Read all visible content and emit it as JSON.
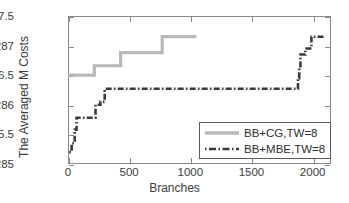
{
  "chart_data": {
    "type": "line",
    "title": "",
    "xlabel": "Branches",
    "ylabel": "The Averaged M Costs",
    "xlim": [
      0,
      2150
    ],
    "ylim": [
      285,
      287.5
    ],
    "xticks": [
      0,
      500,
      1000,
      1500,
      2000
    ],
    "yticks": [
      "285",
      "285.5",
      "286",
      "286.5",
      "287",
      "287.5"
    ],
    "ytick_values": [
      285,
      285.5,
      286,
      286.5,
      287,
      287.5
    ],
    "grid": false,
    "legend_position": "lower right",
    "series": [
      {
        "name": "BB+CG,TW=8",
        "style": "solid",
        "color": "#b9b9b9",
        "points": [
          [
            0,
            286.5
          ],
          [
            215,
            286.5
          ],
          [
            215,
            286.66
          ],
          [
            430,
            286.66
          ],
          [
            430,
            286.88
          ],
          [
            770,
            286.88
          ],
          [
            770,
            287.15
          ],
          [
            1050,
            287.15
          ]
        ]
      },
      {
        "name": "BB+MBE,TW=8",
        "style": "dash-dot",
        "color": "#3a3a3a",
        "points": [
          [
            10,
            285.2
          ],
          [
            30,
            285.2
          ],
          [
            30,
            285.35
          ],
          [
            55,
            285.35
          ],
          [
            55,
            285.58
          ],
          [
            70,
            285.58
          ],
          [
            70,
            285.78
          ],
          [
            225,
            285.78
          ],
          [
            225,
            286.0
          ],
          [
            265,
            286.0
          ],
          [
            265,
            286.05
          ],
          [
            300,
            286.05
          ],
          [
            300,
            286.27
          ],
          [
            1880,
            286.27
          ],
          [
            1880,
            286.45
          ],
          [
            1890,
            286.45
          ],
          [
            1890,
            286.62
          ],
          [
            1900,
            286.62
          ],
          [
            1900,
            286.85
          ],
          [
            1940,
            286.85
          ],
          [
            1940,
            286.95
          ],
          [
            1990,
            286.95
          ],
          [
            1990,
            287.15
          ],
          [
            2090,
            287.15
          ]
        ]
      }
    ]
  },
  "legend": {
    "entries": [
      {
        "label": "BB+CG,TW=8"
      },
      {
        "label": "BB+MBE,TW=8"
      }
    ]
  }
}
